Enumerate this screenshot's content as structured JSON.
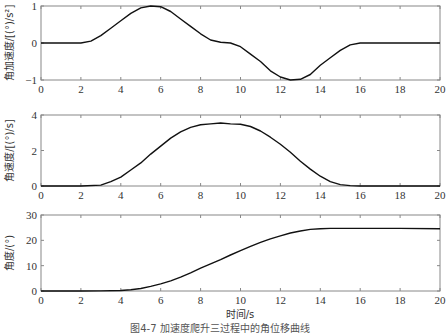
{
  "figure": {
    "caption": "图4-7 加速度爬升三过程中的角位移曲线",
    "xlabel": "时间/s"
  },
  "chart_data": [
    {
      "type": "line",
      "title": "",
      "xlabel": "",
      "ylabel": "角加速度/[(°)/s²]",
      "xlim": [
        0,
        20
      ],
      "ylim": [
        -1,
        1
      ],
      "xticks": [
        0,
        2,
        4,
        6,
        8,
        10,
        12,
        14,
        16,
        18,
        20
      ],
      "yticks": [
        -1,
        0,
        1
      ],
      "grid": false,
      "series": [
        {
          "name": "angular acceleration",
          "x": [
            0,
            2,
            2.5,
            3,
            3.5,
            4,
            4.5,
            5,
            5.5,
            6,
            6.5,
            7,
            7.5,
            8,
            8.5,
            9,
            9.5,
            10,
            10.5,
            11,
            11.5,
            12,
            12.5,
            13,
            13.5,
            14,
            14.5,
            15,
            15.5,
            16,
            18,
            20
          ],
          "y": [
            0,
            0,
            0.05,
            0.2,
            0.4,
            0.6,
            0.8,
            0.95,
            1.0,
            0.98,
            0.85,
            0.65,
            0.45,
            0.25,
            0.08,
            0.02,
            0.0,
            -0.1,
            -0.3,
            -0.5,
            -0.75,
            -0.92,
            -1.0,
            -0.98,
            -0.85,
            -0.6,
            -0.4,
            -0.2,
            -0.05,
            0,
            0,
            0
          ]
        }
      ]
    },
    {
      "type": "line",
      "title": "",
      "xlabel": "",
      "ylabel": "角速度/[(°)/s]",
      "xlim": [
        0,
        20
      ],
      "ylim": [
        0,
        4
      ],
      "xticks": [
        0,
        2,
        4,
        6,
        8,
        10,
        12,
        14,
        16,
        18,
        20
      ],
      "yticks": [
        0,
        2,
        4
      ],
      "grid": false,
      "series": [
        {
          "name": "angular velocity",
          "x": [
            0,
            2,
            3,
            3.5,
            4,
            4.5,
            5,
            5.5,
            6,
            6.5,
            7,
            7.5,
            8,
            8.5,
            9,
            9.5,
            10,
            10.5,
            11,
            11.5,
            12,
            12.5,
            13,
            13.5,
            14,
            14.5,
            15,
            15.5,
            16,
            18,
            20
          ],
          "y": [
            0,
            0,
            0.05,
            0.25,
            0.5,
            0.9,
            1.3,
            1.8,
            2.25,
            2.7,
            3.05,
            3.3,
            3.45,
            3.5,
            3.55,
            3.5,
            3.48,
            3.35,
            3.1,
            2.75,
            2.35,
            1.9,
            1.4,
            0.95,
            0.55,
            0.25,
            0.08,
            0.02,
            0,
            0,
            0
          ]
        }
      ]
    },
    {
      "type": "line",
      "title": "",
      "xlabel": "时间/s",
      "ylabel": "角度/(°)",
      "xlim": [
        0,
        20
      ],
      "ylim": [
        0,
        30
      ],
      "xticks": [
        0,
        2,
        4,
        6,
        8,
        10,
        12,
        14,
        16,
        18,
        20
      ],
      "yticks": [
        0,
        10,
        20,
        30
      ],
      "grid": false,
      "series": [
        {
          "name": "angle",
          "x": [
            0,
            2,
            3,
            4,
            4.5,
            5,
            5.5,
            6,
            6.5,
            7,
            7.5,
            8,
            8.5,
            9,
            9.5,
            10,
            10.5,
            11,
            11.5,
            12,
            12.5,
            13,
            13.5,
            14,
            14.5,
            15,
            16,
            18,
            20
          ],
          "y": [
            0,
            0,
            0.05,
            0.2,
            0.5,
            1.0,
            1.8,
            2.8,
            4.0,
            5.5,
            7.2,
            9.0,
            10.7,
            12.4,
            14.2,
            15.9,
            17.6,
            19.2,
            20.6,
            21.8,
            22.9,
            23.7,
            24.3,
            24.6,
            24.7,
            24.7,
            24.7,
            24.7,
            24.6
          ]
        }
      ]
    }
  ]
}
